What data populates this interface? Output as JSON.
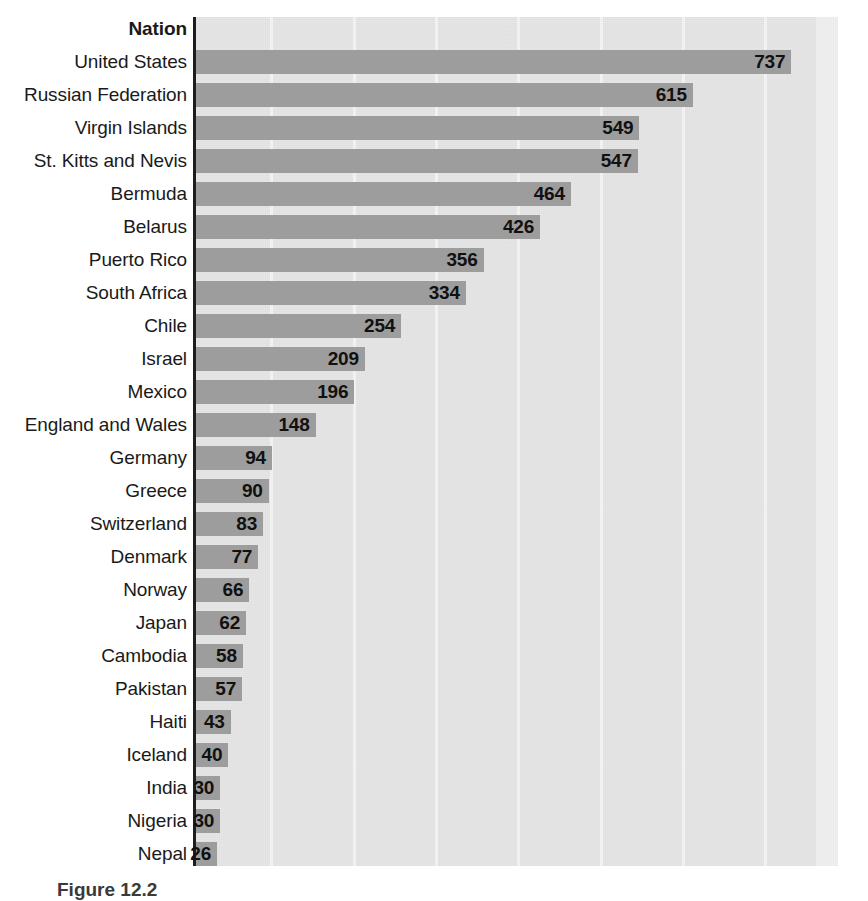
{
  "chart_data": {
    "type": "bar",
    "orientation": "horizontal",
    "title": "",
    "xlabel": "",
    "ylabel": "Nation",
    "header_label": "Nation",
    "xlim": [
      0,
      796
    ],
    "grid": true,
    "grid_axis": "x",
    "gridline_values": [
      93,
      195,
      297,
      399,
      501,
      603,
      705
    ],
    "legend": "none",
    "categories": [
      "United States",
      "Russian Federation",
      "Virgin Islands",
      "St. Kitts and Nevis",
      "Bermuda",
      "Belarus",
      "Puerto Rico",
      "South Africa",
      "Chile",
      "Israel",
      "Mexico",
      "England and Wales",
      "Germany",
      "Greece",
      "Switzerland",
      "Denmark",
      "Norway",
      "Japan",
      "Cambodia",
      "Pakistan",
      "Haiti",
      "Iceland",
      "India",
      "Nigeria",
      "Nepal"
    ],
    "values": [
      737,
      615,
      549,
      547,
      464,
      426,
      356,
      334,
      254,
      209,
      196,
      148,
      94,
      90,
      83,
      77,
      66,
      62,
      58,
      57,
      43,
      40,
      30,
      30,
      26
    ],
    "bar_color": "#9d9d9d",
    "plot_background": "#e6e6e6",
    "gridline_color": "#f4f4f4",
    "axis_color": "#1d1d1d",
    "value_label_color": "#111111"
  },
  "caption": {
    "text": "Figure 12.2"
  }
}
